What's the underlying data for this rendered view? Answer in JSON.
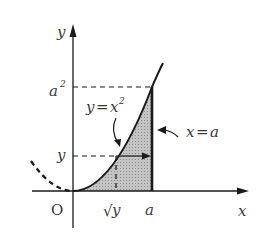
{
  "diagram": {
    "axes": {
      "x_label": "x",
      "y_label": "y",
      "origin_label": "O"
    },
    "tick_labels": {
      "x_a": "a",
      "x_sqrt_y_radical": "√",
      "x_sqrt_y_var": "y",
      "y_level": "y",
      "y_a2_base": "a",
      "y_a2_exp": "2"
    },
    "curve_label": {
      "lhs": "y",
      "eq": "=",
      "base": "x",
      "exp": "2"
    },
    "line_label": {
      "lhs": "x",
      "eq": "=",
      "rhs": "a"
    },
    "colors": {
      "stroke": "#1a1a1a",
      "shade": "#b8b8b8",
      "text": "#3a3a3a"
    }
  }
}
